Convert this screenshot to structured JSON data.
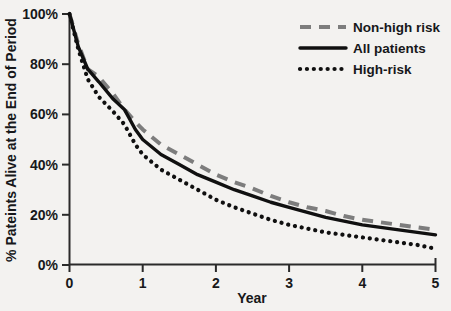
{
  "chart_data": {
    "type": "line",
    "title": "",
    "xlabel": "Year",
    "ylabel": "% Pateints Alive at the End of Period",
    "xlim": [
      0,
      5
    ],
    "ylim": [
      0,
      100
    ],
    "xticks": [
      "0",
      "1",
      "2",
      "3",
      "4",
      "5"
    ],
    "yticks": [
      "0%",
      "20%",
      "40%",
      "60%",
      "80%",
      "100%"
    ],
    "grid": false,
    "legend_position": "top-right",
    "series": [
      {
        "name": "Non-high risk",
        "style": "dashed",
        "color": "#7d7d7d",
        "x": [
          0,
          0.12,
          0.25,
          0.4,
          0.6,
          0.75,
          0.9,
          1.0,
          1.25,
          1.5,
          1.75,
          2.0,
          2.25,
          2.5,
          2.75,
          3.0,
          3.25,
          3.5,
          3.75,
          4.0,
          4.25,
          4.5,
          4.75,
          5.0
        ],
        "values": [
          100,
          88,
          78,
          75,
          68,
          62,
          57,
          54,
          48,
          44,
          40,
          36,
          33,
          30.5,
          27.5,
          25,
          23,
          21.5,
          19.5,
          18,
          17,
          16,
          15,
          14
        ]
      },
      {
        "name": "All patients",
        "style": "solid",
        "color": "#101010",
        "x": [
          0,
          0.12,
          0.25,
          0.4,
          0.6,
          0.75,
          0.9,
          1.0,
          1.25,
          1.5,
          1.75,
          2.0,
          2.25,
          2.5,
          2.75,
          3.0,
          3.25,
          3.5,
          3.75,
          4.0,
          4.25,
          4.5,
          4.75,
          5.0
        ],
        "values": [
          100,
          87,
          78,
          73,
          66,
          62,
          54,
          50,
          44,
          40,
          36,
          33,
          30,
          27.5,
          25,
          23,
          21,
          19,
          17.5,
          16,
          15,
          14,
          13,
          12
        ]
      },
      {
        "name": "High-risk",
        "style": "dotted",
        "color": "#101010",
        "x": [
          0,
          0.12,
          0.25,
          0.4,
          0.6,
          0.75,
          0.9,
          1.0,
          1.25,
          1.5,
          1.75,
          2.0,
          2.25,
          2.5,
          2.75,
          3.0,
          3.25,
          3.5,
          3.75,
          4.0,
          4.25,
          4.5,
          4.75,
          5.0
        ],
        "values": [
          100,
          86,
          74,
          67,
          61,
          56,
          48,
          44,
          38,
          34,
          30,
          26,
          23,
          20.5,
          18,
          16,
          14.5,
          13,
          12,
          11,
          10,
          9,
          8,
          6.5
        ]
      }
    ]
  },
  "legend": {
    "items": [
      {
        "label": "Non-high risk"
      },
      {
        "label": "All patients"
      },
      {
        "label": "High-risk"
      }
    ]
  }
}
